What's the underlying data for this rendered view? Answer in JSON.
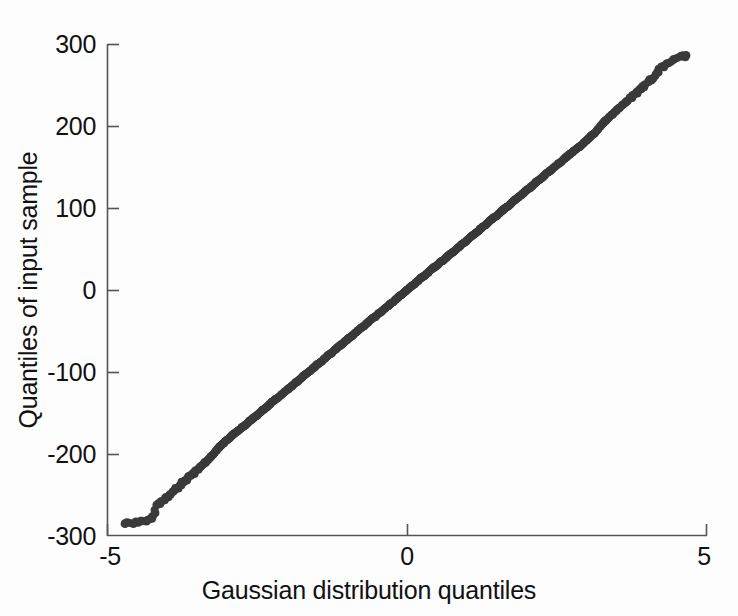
{
  "figure": {
    "background_color": "#fdfdfd",
    "axis_color": "#555555",
    "text_color": "#111111",
    "marker_color": "#3a3a3a"
  },
  "axes": {
    "xlabel": "Gaussian distribution quantiles",
    "ylabel": "Quantiles of input sample",
    "xticks": [
      "-5",
      "0",
      "5"
    ],
    "yticks": [
      "300",
      "200",
      "100",
      "0",
      "-100",
      "-200",
      "-300"
    ]
  },
  "chart_data": {
    "type": "scatter",
    "title": "",
    "xlabel": "Gaussian distribution quantiles",
    "ylabel": "Quantiles of input sample",
    "xlim": [
      -5,
      5
    ],
    "ylim": [
      -300,
      300
    ],
    "xticks": [
      -5,
      0,
      5
    ],
    "yticks": [
      -300,
      -200,
      -100,
      0,
      100,
      200,
      300
    ],
    "grid": false,
    "legend": null,
    "marker": "dot",
    "marker_color": "#3a3a3a",
    "marker_size": 4,
    "fit_line": {
      "slope": 61.0,
      "intercept": 0.0,
      "note": "sample quantile = 61 * gaussian quantile"
    },
    "series": [
      {
        "name": "sample quantiles",
        "x": [
          -4.7,
          -4.56,
          -4.44,
          -4.33,
          -4.24,
          -4.17,
          -4.1,
          -4.03,
          -3.96,
          -3.9,
          -3.84,
          -3.78,
          -3.72,
          -3.66,
          -3.6,
          -3.54,
          -3.48,
          -3.42,
          -3.36,
          -3.3,
          -3.24,
          -3.18,
          -3.12,
          -3.06,
          -3.0,
          -2.94,
          -2.88,
          -2.82,
          -2.76,
          -2.7,
          -2.64,
          -2.58,
          -2.52,
          -2.46,
          -2.4,
          -2.34,
          -2.28,
          -2.22,
          -2.16,
          -2.1,
          -2.04,
          -1.98,
          -1.92,
          -1.86,
          -1.8,
          -1.74,
          -1.68,
          -1.62,
          -1.56,
          -1.5,
          -1.44,
          -1.38,
          -1.32,
          -1.26,
          -1.2,
          -1.14,
          -1.08,
          -1.02,
          -0.96,
          -0.9,
          -0.84,
          -0.78,
          -0.72,
          -0.66,
          -0.6,
          -0.54,
          -0.48,
          -0.42,
          -0.36,
          -0.3,
          -0.24,
          -0.18,
          -0.12,
          -0.06,
          0.0,
          0.06,
          0.12,
          0.18,
          0.24,
          0.3,
          0.36,
          0.42,
          0.48,
          0.54,
          0.6,
          0.66,
          0.72,
          0.78,
          0.84,
          0.9,
          0.96,
          1.02,
          1.08,
          1.14,
          1.2,
          1.26,
          1.32,
          1.38,
          1.44,
          1.5,
          1.56,
          1.62,
          1.68,
          1.74,
          1.8,
          1.86,
          1.92,
          1.98,
          2.04,
          2.1,
          2.16,
          2.22,
          2.28,
          2.34,
          2.4,
          2.46,
          2.52,
          2.58,
          2.64,
          2.7,
          2.76,
          2.82,
          2.88,
          2.94,
          3.0,
          3.06,
          3.12,
          3.18,
          3.24,
          3.3,
          3.36,
          3.42,
          3.48,
          3.54,
          3.6,
          3.66,
          3.72,
          3.78,
          3.84,
          3.9,
          3.96,
          4.03,
          4.1,
          4.17,
          4.24,
          4.33,
          4.44,
          4.56,
          4.65
        ],
        "y": [
          -285,
          -285,
          -282,
          -281,
          -276,
          -262,
          -258,
          -254,
          -250,
          -246,
          -242,
          -238,
          -234,
          -230,
          -226,
          -222,
          -218,
          -214,
          -210,
          -206,
          -201,
          -196,
          -191,
          -187,
          -183,
          -179,
          -175,
          -172,
          -168,
          -165,
          -161,
          -157,
          -154,
          -150,
          -146,
          -143,
          -139,
          -135,
          -132,
          -128,
          -124,
          -121,
          -117,
          -113,
          -110,
          -106,
          -102,
          -99,
          -95,
          -91,
          -88,
          -84,
          -80,
          -77,
          -73,
          -69,
          -66,
          -62,
          -58,
          -55,
          -51,
          -47,
          -44,
          -40,
          -36,
          -33,
          -29,
          -26,
          -22,
          -18,
          -15,
          -11,
          -7,
          -4,
          0,
          4,
          7,
          11,
          15,
          18,
          22,
          26,
          29,
          33,
          36,
          40,
          44,
          47,
          51,
          55,
          58,
          62,
          66,
          69,
          73,
          77,
          80,
          84,
          88,
          91,
          95,
          99,
          102,
          106,
          110,
          113,
          117,
          121,
          124,
          128,
          132,
          135,
          139,
          143,
          146,
          150,
          154,
          157,
          161,
          165,
          168,
          172,
          175,
          179,
          183,
          187,
          191,
          196,
          201,
          206,
          210,
          214,
          218,
          222,
          226,
          230,
          234,
          238,
          242,
          246,
          250,
          254,
          258,
          265,
          272,
          276,
          281,
          285,
          286
        ]
      }
    ]
  }
}
